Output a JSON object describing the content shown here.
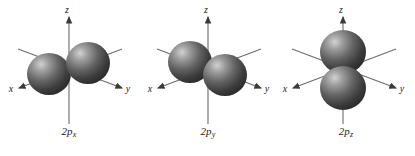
{
  "figure": {
    "background_color": "#ffffff",
    "orbital_color_light": "#c9c9c9",
    "orbital_color_mid": "#6e6e6e",
    "orbital_color_dark": "#2f2f2f",
    "axis_color": "#6b6b6b",
    "text_color": "#1c1c1c"
  },
  "orbitals": [
    {
      "name": "2p-x-orbital",
      "label_main": "2p",
      "label_sub": "x",
      "orientation": "x",
      "axes": [
        {
          "name": "z",
          "letter": "z"
        },
        {
          "name": "y",
          "letter": "y"
        },
        {
          "name": "x",
          "letter": "x"
        }
      ]
    },
    {
      "name": "2p-y-orbital",
      "label_main": "2p",
      "label_sub": "y",
      "orientation": "y",
      "axes": [
        {
          "name": "z",
          "letter": "z"
        },
        {
          "name": "y",
          "letter": "y"
        },
        {
          "name": "x",
          "letter": "x"
        }
      ]
    },
    {
      "name": "2p-z-orbital",
      "label_main": "2p",
      "label_sub": "z",
      "orientation": "z",
      "axes": [
        {
          "name": "z",
          "letter": "z"
        },
        {
          "name": "y",
          "letter": "y"
        },
        {
          "name": "x",
          "letter": "x"
        }
      ]
    }
  ]
}
